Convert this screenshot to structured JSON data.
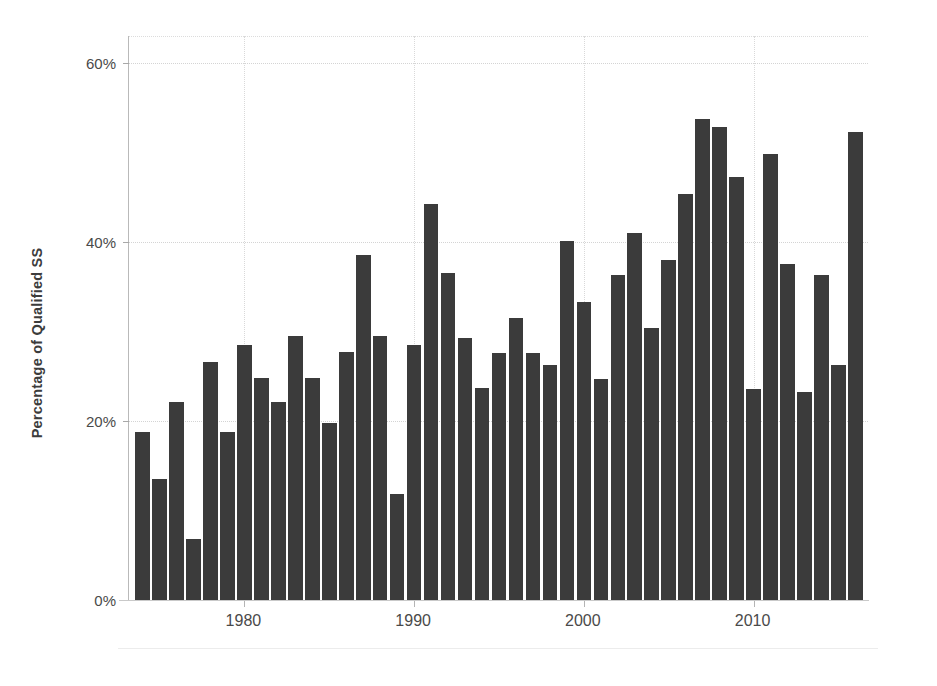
{
  "chart_data": {
    "type": "bar",
    "title": "",
    "subtitle": "",
    "xlabel": "",
    "ylabel": "Percentage of Qualified SS",
    "x_tick_labels": [
      "1980",
      "1990",
      "2000",
      "2010"
    ],
    "x_tick_values": [
      1980,
      1990,
      2000,
      2010
    ],
    "y_tick_labels": [
      "0%",
      "20%",
      "40%",
      "60%"
    ],
    "y_tick_values": [
      0,
      20,
      40,
      60
    ],
    "ylim": [
      0,
      63
    ],
    "xlim": [
      1973.2,
      2016.8
    ],
    "grid": "horizontal-and-vertical-dotted",
    "legend": "none",
    "bar_color": "#3b3b3b",
    "categories": [
      1974,
      1975,
      1976,
      1977,
      1978,
      1979,
      1980,
      1981,
      1982,
      1983,
      1984,
      1985,
      1986,
      1987,
      1988,
      1989,
      1990,
      1991,
      1992,
      1993,
      1994,
      1995,
      1996,
      1997,
      1998,
      1999,
      2000,
      2001,
      2002,
      2003,
      2004,
      2005,
      2006,
      2007,
      2008,
      2009,
      2010,
      2011,
      2012,
      2013,
      2014,
      2015,
      2016
    ],
    "values": [
      18.8,
      13.5,
      22.1,
      6.8,
      26.6,
      18.8,
      28.5,
      24.8,
      22.1,
      29.5,
      24.8,
      19.8,
      27.7,
      38.5,
      29.5,
      11.8,
      28.5,
      44.2,
      36.5,
      29.3,
      23.7,
      27.6,
      31.5,
      27.6,
      26.2,
      40.1,
      33.3,
      24.7,
      36.3,
      41.0,
      30.4,
      38.0,
      45.3,
      53.7,
      52.8,
      47.2,
      23.6,
      49.8,
      37.5,
      23.2,
      36.3,
      26.2,
      52.3
    ]
  }
}
